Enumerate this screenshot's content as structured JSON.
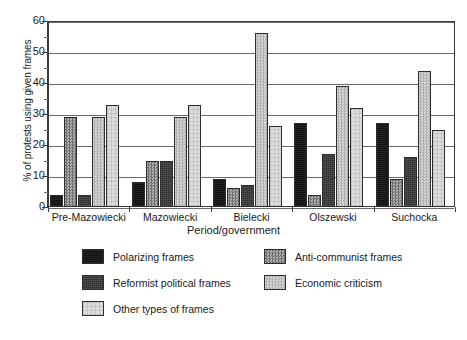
{
  "chart_data": {
    "type": "bar",
    "title": "",
    "xlabel": "Period/government",
    "ylabel": "% of protests using given frames",
    "ylim": [
      0,
      60
    ],
    "ytick_step": 10,
    "yticks": [
      0,
      10,
      20,
      30,
      40,
      50,
      60
    ],
    "ytick_labels": [
      "0",
      "10",
      "20",
      "30",
      "40",
      "50",
      "60"
    ],
    "minor_tick_step": 5,
    "grid": true,
    "grid_axis": "y",
    "legend_position": "bottom",
    "categories": [
      "Pre-Mazowiecki",
      "Mazowiecki",
      "Bielecki",
      "Olszewski",
      "Suchocka"
    ],
    "series": [
      {
        "name": "Polarizing frames",
        "color": "#131313",
        "pattern": "solid-black",
        "values": [
          4,
          8,
          9,
          27,
          27
        ]
      },
      {
        "name": "Anti-communist frames",
        "color": "#8f8f8f",
        "pattern": "checker-medium",
        "values": [
          29,
          15,
          6,
          4,
          9
        ]
      },
      {
        "name": "Reformist political frames",
        "color": "#2e2e2e",
        "pattern": "checker-dark",
        "values": [
          4,
          15,
          7,
          17,
          16
        ]
      },
      {
        "name": "Economic criticism",
        "color": "#c3c3c3",
        "pattern": "checker-light",
        "values": [
          29,
          29,
          56,
          39,
          44
        ]
      },
      {
        "name": "Other types of frames",
        "color": "#dcdcdc",
        "pattern": "grid-faint",
        "values": [
          33,
          33,
          26,
          32,
          25
        ]
      }
    ]
  },
  "axes": {
    "y_title": "% of protests using given frames",
    "x_title": "Period/government",
    "y_tick_labels": [
      "60",
      "50",
      "40",
      "30",
      "20",
      "10",
      "0"
    ],
    "x_tick_labels": [
      "Pre-Mazowiecki",
      "Mazowiecki",
      "Bielecki",
      "Olszewski",
      "Suchocka"
    ]
  },
  "legend": {
    "entries": [
      {
        "label": "Polarizing frames",
        "swatch": "fill-polarizing"
      },
      {
        "label": "Anti-communist frames",
        "swatch": "fill-anticommunist"
      },
      {
        "label": "Reformist political frames",
        "swatch": "fill-reformist"
      },
      {
        "label": "Economic criticism",
        "swatch": "fill-economic"
      },
      {
        "label": "Other types of frames",
        "swatch": "fill-other"
      }
    ]
  }
}
